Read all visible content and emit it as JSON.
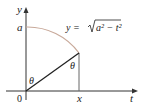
{
  "diagram": {
    "axes": {
      "y_label": "y",
      "x_label": "t",
      "origin_label": "0"
    },
    "labels": {
      "a_label": "a",
      "x_point_label": "x",
      "theta_origin": "θ",
      "theta_point": "θ",
      "curve_eq_prefix": "y = ",
      "curve_eq_radicand": "a² − t²"
    },
    "colors": {
      "axis": "#333333",
      "curve": "#c8a99a",
      "radius": "#222222",
      "vertical": "#666666"
    }
  }
}
